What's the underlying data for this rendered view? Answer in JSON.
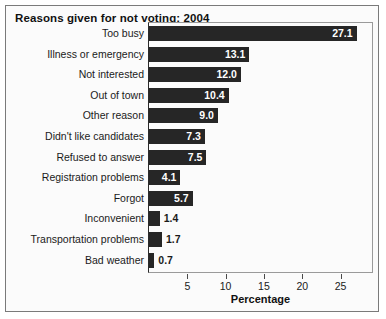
{
  "chart_data": {
    "type": "bar",
    "orientation": "horizontal",
    "title": "Reasons given for not voting: 2004",
    "xlabel": "Percentage",
    "ylabel": "",
    "categories": [
      "Too busy",
      "Illness or emergency",
      "Not interested",
      "Out of town",
      "Other reason",
      "Didn't like candidates",
      "Refused to answer",
      "Registration problems",
      "Forgot",
      "Inconvenient",
      "Transportation problems",
      "Bad weather"
    ],
    "values": [
      27.1,
      13.1,
      12.0,
      10.4,
      9.0,
      7.3,
      7.5,
      4.1,
      5.7,
      1.4,
      1.7,
      0.7
    ],
    "value_labels": [
      "27.1",
      "13.1",
      "12.0",
      "10.4",
      "9.0",
      "7.3",
      "7.5",
      "4.1",
      "5.7",
      "1.4",
      "1.7",
      "0.7"
    ],
    "label_placement": [
      "inside",
      "inside",
      "inside",
      "inside",
      "inside",
      "inside",
      "inside",
      "inside",
      "inside",
      "outside",
      "outside",
      "outside"
    ],
    "xlim": [
      0,
      29.5
    ],
    "xticks": [
      5,
      10,
      15,
      20,
      25
    ],
    "xtick_labels": [
      "5",
      "10",
      "15",
      "20",
      "25"
    ],
    "grid": false,
    "legend": null,
    "bar_color": "#262626",
    "background_color": "#fbfbfb",
    "text_color": "#1a1a1a"
  }
}
